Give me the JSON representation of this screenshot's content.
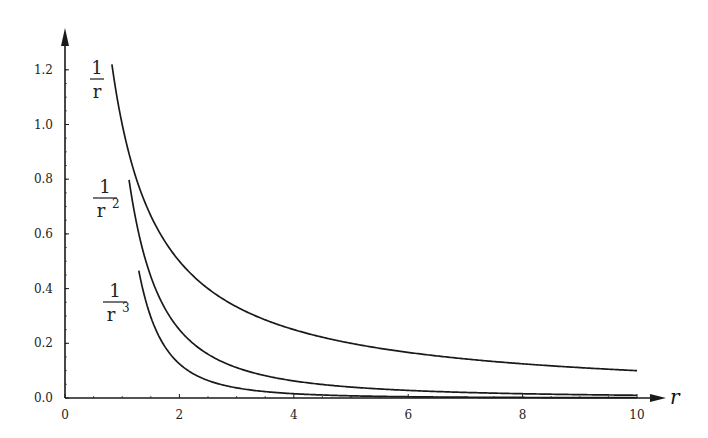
{
  "chart_data": {
    "type": "line",
    "title": "",
    "xlabel": "r",
    "ylabel": "",
    "xlim": [
      0,
      10
    ],
    "ylim": [
      0,
      1.3
    ],
    "grid": false,
    "legend_position": "inline labels near curve starts",
    "x_ticks": [
      "0",
      "2",
      "4",
      "6",
      "8",
      "10"
    ],
    "y_ticks": [
      "0.0",
      "0.2",
      "0.4",
      "0.6",
      "0.8",
      "1.0",
      "1.2"
    ],
    "series": [
      {
        "name": "1/r",
        "label_num": "1",
        "label_den": "r",
        "label_exp": "",
        "r_start": 0.82,
        "r_end": 10,
        "formula_power": 1
      },
      {
        "name": "1/r^2",
        "label_num": "1",
        "label_den": "r",
        "label_exp": "2",
        "r_start": 1.12,
        "r_end": 10,
        "formula_power": 2
      },
      {
        "name": "1/r^3",
        "label_num": "1",
        "label_den": "r",
        "label_exp": "3",
        "r_start": 1.29,
        "r_end": 10,
        "formula_power": 3
      }
    ],
    "sample_points": {
      "1/r": [
        [
          0.82,
          1.22
        ],
        [
          1,
          1.0
        ],
        [
          2,
          0.5
        ],
        [
          4,
          0.25
        ],
        [
          6,
          0.167
        ],
        [
          8,
          0.125
        ],
        [
          10,
          0.1
        ]
      ],
      "1/r^2": [
        [
          1.12,
          0.8
        ],
        [
          2,
          0.25
        ],
        [
          4,
          0.0625
        ],
        [
          6,
          0.028
        ],
        [
          8,
          0.016
        ],
        [
          10,
          0.01
        ]
      ],
      "1/r^3": [
        [
          1.29,
          0.47
        ],
        [
          2,
          0.125
        ],
        [
          4,
          0.016
        ],
        [
          6,
          0.005
        ],
        [
          8,
          0.002
        ],
        [
          10,
          0.001
        ]
      ]
    }
  },
  "colors": {
    "line": "#1a1a1a",
    "axis": "#1a1a1a",
    "background": "#ffffff"
  }
}
